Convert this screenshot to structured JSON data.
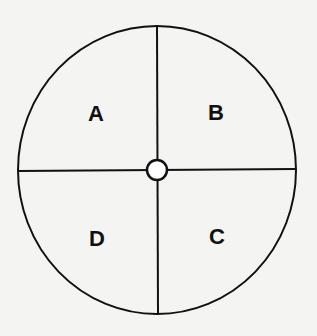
{
  "diagram": {
    "type": "quadrant-circle",
    "quadrants": [
      {
        "label": "A",
        "position": "top-left"
      },
      {
        "label": "B",
        "position": "top-right"
      },
      {
        "label": "C",
        "position": "bottom-right"
      },
      {
        "label": "D",
        "position": "bottom-left"
      }
    ],
    "colors": {
      "line": "#111111",
      "background": "#f4f4f2",
      "center_fill": "#ffffff"
    }
  }
}
